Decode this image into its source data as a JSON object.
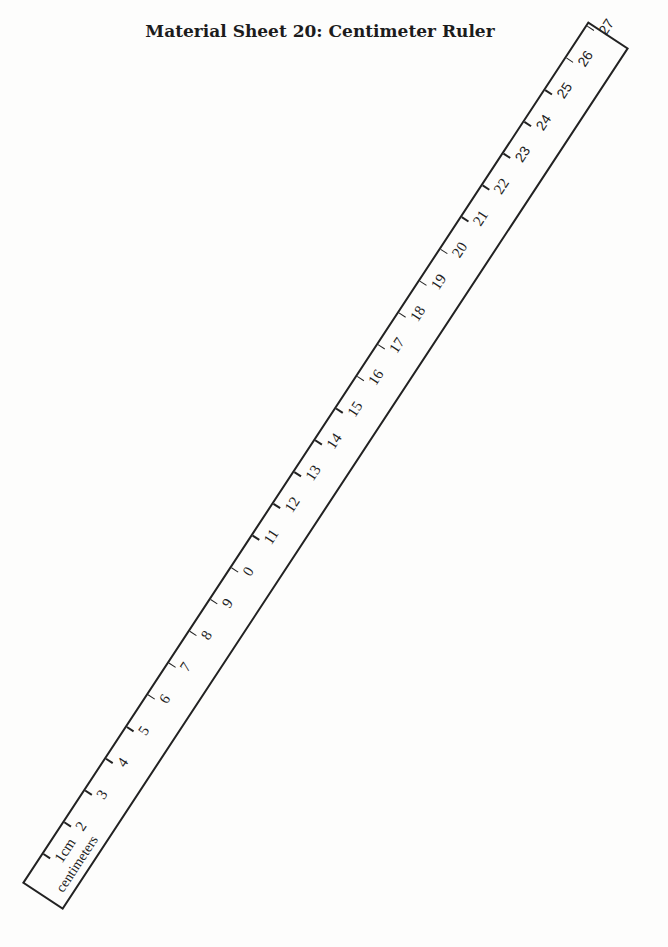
{
  "page": {
    "title": "Material Sheet 20: Centimeter Ruler"
  },
  "ruler": {
    "unit_caption": "centimeters",
    "ticks": [
      {
        "value": 1,
        "label": "1cm",
        "style": "serif"
      },
      {
        "value": 2,
        "label": "2",
        "style": "serif"
      },
      {
        "value": 3,
        "label": "3",
        "style": "serif"
      },
      {
        "value": 4,
        "label": "4",
        "style": "serif"
      },
      {
        "value": 5,
        "label": "5",
        "style": "serif"
      },
      {
        "value": 6,
        "label": "6",
        "style": "serif"
      },
      {
        "value": 7,
        "label": "7",
        "style": "serif"
      },
      {
        "value": 8,
        "label": "8",
        "style": "serif"
      },
      {
        "value": 9,
        "label": "9",
        "style": "serif"
      },
      {
        "value": 10,
        "label": "0",
        "style": "serif"
      },
      {
        "value": 11,
        "label": "11",
        "style": "serif"
      },
      {
        "value": 12,
        "label": "12",
        "style": "serif"
      },
      {
        "value": 13,
        "label": "13",
        "style": "serif"
      },
      {
        "value": 14,
        "label": "14",
        "style": "serif"
      },
      {
        "value": 15,
        "label": "15",
        "style": "serif"
      },
      {
        "value": 16,
        "label": "16",
        "style": "serif"
      },
      {
        "value": 17,
        "label": "17",
        "style": "serif"
      },
      {
        "value": 18,
        "label": "18",
        "style": "serif"
      },
      {
        "value": 19,
        "label": "19",
        "style": "serif"
      },
      {
        "value": 20,
        "label": "20",
        "style": "serif"
      },
      {
        "value": 21,
        "label": "21",
        "style": "serif"
      },
      {
        "value": 22,
        "label": "22",
        "style": "serif"
      },
      {
        "value": 23,
        "label": "23",
        "style": "sans"
      },
      {
        "value": 24,
        "label": "24",
        "style": "sans"
      },
      {
        "value": 25,
        "label": "25",
        "style": "sans"
      },
      {
        "value": 26,
        "label": "26",
        "style": "sans"
      },
      {
        "value": 27,
        "label": "27",
        "style": "sans"
      }
    ]
  }
}
